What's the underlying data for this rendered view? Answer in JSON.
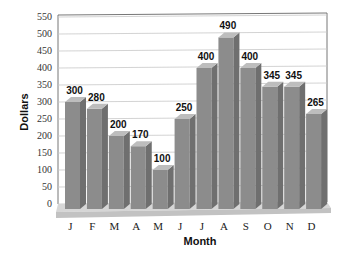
{
  "chart_data": {
    "type": "bar",
    "title": "",
    "xlabel": "Month",
    "ylabel": "Dollars",
    "categories": [
      "J",
      "F",
      "M",
      "A",
      "M",
      "J",
      "J",
      "A",
      "S",
      "O",
      "N",
      "D"
    ],
    "values": [
      300,
      280,
      200,
      170,
      100,
      250,
      400,
      490,
      400,
      345,
      345,
      265
    ],
    "ylim": [
      0,
      550
    ],
    "yticks": [
      0,
      50,
      100,
      150,
      200,
      250,
      300,
      350,
      400,
      450,
      500,
      550
    ],
    "grid": true,
    "style": "3d",
    "data_labels": true,
    "legend": null
  },
  "colors": {
    "bar_front": "#8c8c8c",
    "bar_side": "#6f6f6f",
    "bar_top": "#bdbdbd",
    "floor": "#d6d6d6",
    "grid": "#c8c8c8"
  }
}
